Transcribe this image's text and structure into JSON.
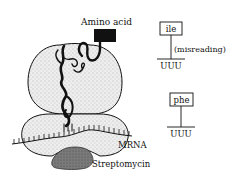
{
  "diagram": {
    "labels": {
      "amino_acid": "Amino acid",
      "mrna": "MRNA",
      "streptomycin": "Streptomycin"
    },
    "codon_panels": [
      {
        "amino_acid": "ile",
        "codon": "UUU",
        "note": "(misreading)"
      },
      {
        "amino_acid": "phe",
        "codon": "UUU",
        "note": ""
      }
    ],
    "colors": {
      "ribosome_fill": "#ececec",
      "streptomycin_fill": "#7a7a7a",
      "stroke": "#111111"
    }
  }
}
